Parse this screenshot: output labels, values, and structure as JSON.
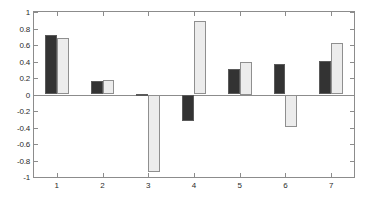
{
  "chart_data": {
    "type": "bar",
    "title": "",
    "subtitle": "",
    "xlabel": "",
    "ylabel": "",
    "categories": [
      "1",
      "2",
      "3",
      "4",
      "5",
      "6",
      "7"
    ],
    "series": [
      {
        "name": "series-1",
        "color": "#333333",
        "values": [
          0.72,
          0.16,
          0.01,
          -0.32,
          0.31,
          0.37,
          0.41
        ]
      },
      {
        "name": "series-2",
        "color": "#ececec",
        "values": [
          0.68,
          0.17,
          -0.94,
          0.89,
          0.4,
          -0.39,
          0.62
        ]
      }
    ],
    "ylim": [
      -1,
      1
    ],
    "yticks": [
      1,
      0.8,
      0.6,
      0.4,
      0.2,
      0,
      -0.2,
      -0.4,
      -0.6,
      -0.8,
      -1
    ],
    "ytick_labels": [
      "1",
      "0.8",
      "0.6",
      "0.4",
      "0.2",
      "0",
      "-0.2",
      "-0.4",
      "-0.6",
      "-0.8",
      "-1"
    ],
    "xticks": [
      1,
      2,
      3,
      4,
      5,
      6,
      7
    ],
    "xtick_labels": [
      "1",
      "2",
      "3",
      "4",
      "5",
      "6",
      "7"
    ],
    "xlim": [
      0.5,
      7.5
    ],
    "grid": false,
    "legend": null,
    "legend_position": "none",
    "annotations": [],
    "axis_color": "#8c8c8c",
    "background_color": "#ffffff"
  }
}
